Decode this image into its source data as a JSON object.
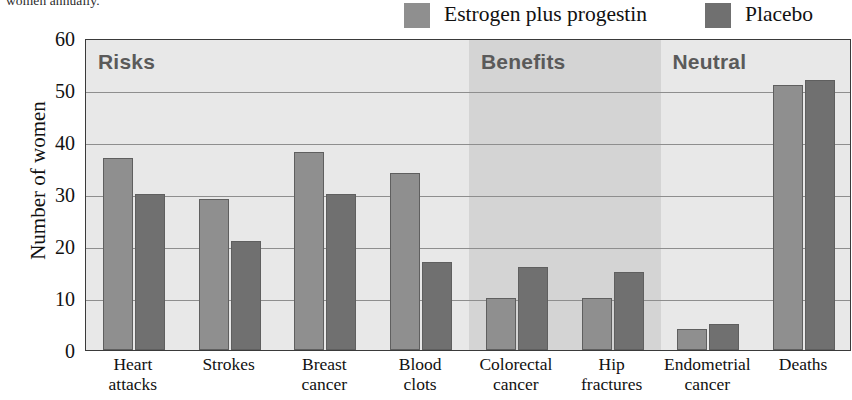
{
  "caption_fragment": "women annually.",
  "legend": {
    "items": [
      {
        "label": "Estrogen plus progestin",
        "color": "#8f8f8f",
        "swatch_name": "legend-swatch-estrogen"
      },
      {
        "label": "Placebo",
        "color": "#707070",
        "swatch_name": "legend-swatch-placebo"
      }
    ]
  },
  "chart_data": {
    "type": "bar",
    "title": "",
    "xlabel": "",
    "ylabel": "Number of women",
    "ylim": [
      0,
      60
    ],
    "yticks": [
      0,
      10,
      20,
      30,
      40,
      50,
      60
    ],
    "grid": true,
    "legend_position": "top-right",
    "categories": [
      "Heart attacks",
      "Strokes",
      "Breast cancer",
      "Blood clots",
      "Colorectal cancer",
      "Hip fractures",
      "Endometrial cancer",
      "Deaths"
    ],
    "category_lines": [
      [
        "Heart",
        "attacks"
      ],
      [
        "Strokes",
        ""
      ],
      [
        "Breast",
        "cancer"
      ],
      [
        "Blood",
        "clots"
      ],
      [
        "Colorectal",
        "cancer"
      ],
      [
        "Hip",
        "fractures"
      ],
      [
        "Endometrial",
        "cancer"
      ],
      [
        "Deaths",
        ""
      ]
    ],
    "series": [
      {
        "name": "Estrogen plus progestin",
        "color": "#8f8f8f",
        "values": [
          37,
          29,
          38,
          34,
          10,
          10,
          4,
          51
        ]
      },
      {
        "name": "Placebo",
        "color": "#707070",
        "values": [
          30,
          21,
          30,
          17,
          16,
          15,
          5,
          52
        ]
      }
    ],
    "zones": [
      {
        "label": "Risks",
        "start_category": 0,
        "end_category": 3,
        "band_color": "#e8e8e8"
      },
      {
        "label": "Benefits",
        "start_category": 4,
        "end_category": 5,
        "band_color": "#d4d4d4"
      },
      {
        "label": "Neutral",
        "start_category": 6,
        "end_category": 7,
        "band_color": "#e8e8e8"
      }
    ],
    "annotations": []
  }
}
